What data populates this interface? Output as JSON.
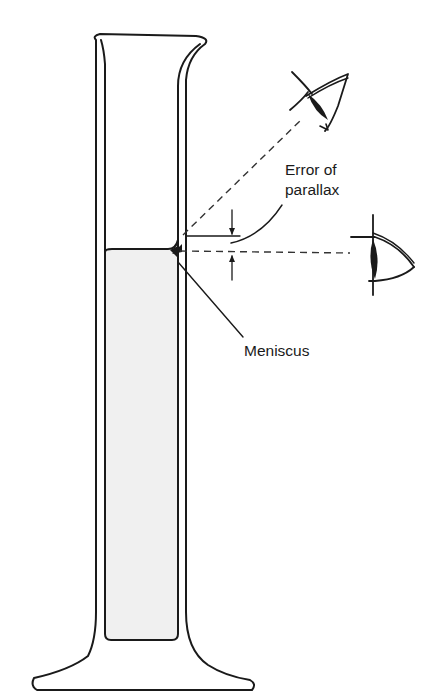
{
  "diagram": {
    "labels": {
      "error_of_parallax_line1": "Error of",
      "error_of_parallax_line2": "parallax",
      "meniscus": "Meniscus"
    },
    "elements": [
      {
        "id": "graduated-cylinder",
        "description": "tall glass cylinder with pouring spout and flared base"
      },
      {
        "id": "liquid",
        "description": "liquid column filling cylinder, top forms concave meniscus"
      },
      {
        "id": "eye-above",
        "description": "eye viewing from above at an angle (incorrect)"
      },
      {
        "id": "eye-level",
        "description": "eye at level of meniscus (correct)"
      },
      {
        "id": "sightline-above",
        "description": "dashed line from upper eye to cylinder"
      },
      {
        "id": "sightline-level",
        "description": "dashed horizontal line from level eye to meniscus"
      },
      {
        "id": "parallax-dimension",
        "description": "dimension arrows showing vertical error offset"
      }
    ],
    "colors": {
      "line": "#1a1a1a",
      "liquid_fill": "#f0f0f0",
      "background": "#ffffff"
    }
  }
}
